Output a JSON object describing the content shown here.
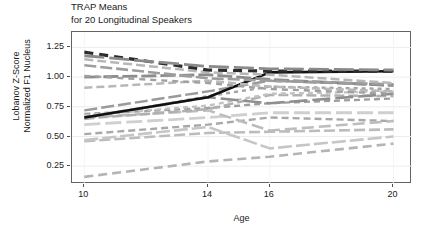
{
  "chart_data": {
    "type": "line",
    "title": "TRAP Means for 20 Longitudinal Speakers",
    "title_lines": [
      "TRAP Means",
      "for 20 Longitudinal Speakers"
    ],
    "xlabel": "Age",
    "ylabel": "Lobanov Z-Score Normalized F1 Nucleus",
    "ylabel_lines": [
      "Lobanov Z-Score",
      "Normalized F1 Nucleus"
    ],
    "x_ticks": [
      10,
      14,
      16,
      20
    ],
    "x_tick_labels": [
      "10",
      "14",
      "16",
      "20"
    ],
    "y_ticks": [
      0.25,
      0.5,
      0.75,
      1.0,
      1.25
    ],
    "y_tick_labels": [
      "0.25",
      "0.50",
      "0.75",
      "1.00",
      "1.25"
    ],
    "xlim": [
      9.6,
      20.6
    ],
    "ylim": [
      1.38,
      0.1
    ],
    "y_axis_inverted": true,
    "grid": true,
    "legend": "none",
    "n_series": 20,
    "x": [
      10,
      14,
      16,
      20
    ],
    "series": [
      {
        "name": "speaker-01",
        "values": [
          0.16,
          0.29,
          0.33,
          0.44
        ],
        "color": "#b4b4b4",
        "dash": "9 5",
        "width": 2.6
      },
      {
        "name": "speaker-02",
        "values": [
          0.46,
          0.53,
          0.54,
          0.56
        ],
        "color": "#bcbcbc",
        "dash": "11 4",
        "width": 2.6
      },
      {
        "name": "speaker-03",
        "values": [
          0.47,
          0.58,
          0.4,
          0.5
        ],
        "color": "#c6c6c6",
        "dash": "14 4",
        "width": 2.6
      },
      {
        "name": "speaker-04",
        "values": [
          0.52,
          0.6,
          0.66,
          0.63
        ],
        "color": "#a8a8a8",
        "dash": "7 4",
        "width": 2.4
      },
      {
        "name": "speaker-05",
        "values": [
          0.6,
          0.66,
          0.7,
          0.7
        ],
        "color": "#cfcfcf",
        "dash": "16 5",
        "width": 2.8
      },
      {
        "name": "speaker-06",
        "values": [
          0.66,
          0.72,
          0.55,
          0.63
        ],
        "color": "#bdbdbd",
        "dash": "12 5",
        "width": 2.6
      },
      {
        "name": "speaker-07",
        "values": [
          0.69,
          0.74,
          0.78,
          0.82
        ],
        "color": "#9e9e9e",
        "dash": "6 4",
        "width": 2.3
      },
      {
        "name": "speaker-08",
        "values": [
          0.65,
          0.73,
          0.85,
          0.84
        ],
        "color": "#b0b0b0",
        "dash": "10 4",
        "width": 2.5
      },
      {
        "name": "speaker-09",
        "values": [
          0.68,
          0.76,
          0.86,
          0.88
        ],
        "color": "#c2c2c2",
        "dash": "5 4",
        "width": 2.4
      },
      {
        "name": "speaker-10",
        "values": [
          0.66,
          0.83,
          0.78,
          0.86
        ],
        "color": "#8f8f8f",
        "dash": "18 5",
        "width": 2.6
      },
      {
        "name": "speaker-11",
        "values": [
          0.65,
          0.84,
          0.92,
          0.9
        ],
        "color": "#a3a3a3",
        "dash": "4 4",
        "width": 2.4
      },
      {
        "name": "speaker-12",
        "values": [
          0.72,
          0.88,
          0.97,
          0.93
        ],
        "color": "#9a9a9a",
        "dash": "13 4",
        "width": 2.5
      },
      {
        "name": "speaker-13-solid-black",
        "values": [
          0.66,
          0.83,
          1.04,
          1.05
        ],
        "color": "#111111",
        "dash": "none",
        "width": 2.6
      },
      {
        "name": "speaker-14",
        "values": [
          0.91,
          0.97,
          0.92,
          0.88
        ],
        "color": "#b8b8b8",
        "dash": "8 4",
        "width": 2.5
      },
      {
        "name": "speaker-15",
        "values": [
          1.0,
          1.02,
          0.98,
          0.93
        ],
        "color": "#8c8c8c",
        "dash": "15 4",
        "width": 2.8
      },
      {
        "name": "speaker-16",
        "values": [
          1.01,
          0.95,
          0.9,
          0.86
        ],
        "color": "#a0a0a0",
        "dash": "6 5",
        "width": 2.4
      },
      {
        "name": "speaker-17",
        "values": [
          1.1,
          0.99,
          0.97,
          0.94
        ],
        "color": "#9d9d9d",
        "dash": "12 4",
        "width": 2.6
      },
      {
        "name": "speaker-18",
        "values": [
          1.15,
          1.04,
          1.02,
          0.95
        ],
        "color": "#b6b6b6",
        "dash": "9 4",
        "width": 2.5
      },
      {
        "name": "speaker-19-thick-black-dashed",
        "values": [
          1.21,
          1.06,
          1.05,
          1.05
        ],
        "color": "#2b2b2b",
        "dash": "9 6",
        "width": 3.2
      },
      {
        "name": "speaker-20",
        "values": [
          1.18,
          1.09,
          1.07,
          1.06
        ],
        "color": "#8a8a8a",
        "dash": "20 5",
        "width": 2.8
      }
    ]
  }
}
